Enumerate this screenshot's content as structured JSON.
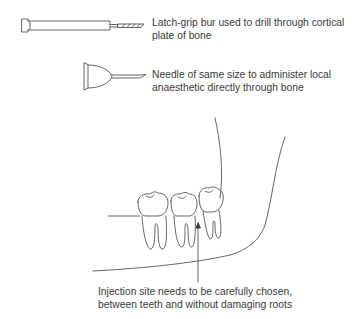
{
  "diagram": {
    "instruments": [
      {
        "name": "latch-grip bur",
        "label_line1": "Latch-grip bur used to drill through cortical",
        "label_line2": "plate of bone"
      },
      {
        "name": "needle",
        "label_line1": "Needle of same size to administer local",
        "label_line2": "anaesthetic directly through bone"
      }
    ],
    "injection_site": {
      "label_line1": "Injection site needs to be carefully chosen,",
      "label_line2": "between teeth and without damaging roots"
    },
    "colors": {
      "line": "#555555",
      "text": "#3a3a3a",
      "background": "#ffffff"
    }
  }
}
